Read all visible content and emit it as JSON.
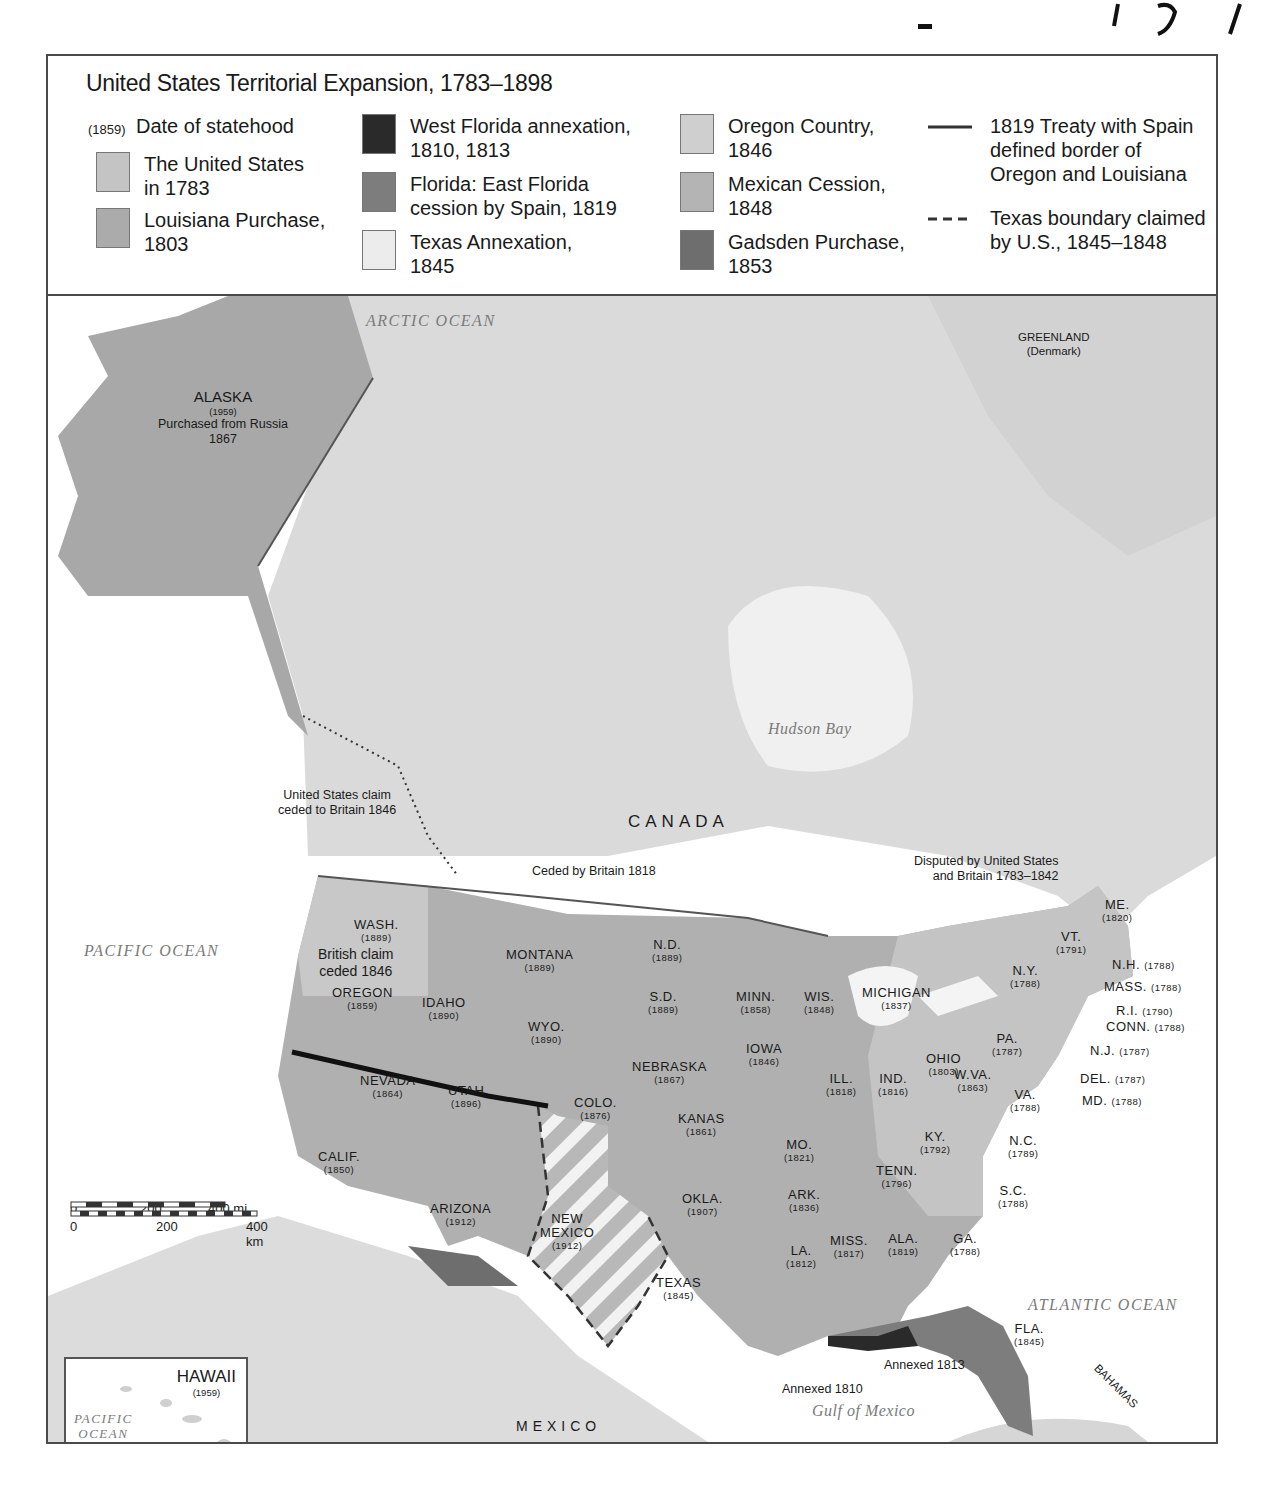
{
  "legend": {
    "title": "United States Territorial Expansion, 1783–1898",
    "statehood_marker": "(1859)",
    "statehood_label": "Date of statehood",
    "items": [
      {
        "label_line1": "The United States",
        "label_line2": "in 1783",
        "color": "#c4c4c4"
      },
      {
        "label_line1": "Louisiana Purchase,",
        "label_line2": "1803",
        "color": "#ababab"
      },
      {
        "label_line1": "West Florida annexation,",
        "label_line2": "1810, 1813",
        "color": "#2a2a2a"
      },
      {
        "label_line1": "Florida: East Florida",
        "label_line2": "cession by Spain, 1819",
        "color": "#7d7d7d"
      },
      {
        "label_line1": "Texas Annexation,",
        "label_line2": "1845",
        "color": "#ececec"
      },
      {
        "label_line1": "Oregon Country,",
        "label_line2": "1846",
        "color": "#cfcfcf"
      },
      {
        "label_line1": "Mexican Cession,",
        "label_line2": "1848",
        "color": "#b4b4b4"
      },
      {
        "label_line1": "Gadsden Purchase,",
        "label_line2": "1853",
        "color": "#6e6e6e"
      }
    ],
    "lines": [
      {
        "label_line1": "1819 Treaty with Spain",
        "label_line2": "defined border of",
        "label_line3": "Oregon and Louisiana",
        "style": "solid"
      },
      {
        "label_line1": "Texas boundary claimed",
        "label_line2": "by U.S., 1845–1848",
        "style": "dashed"
      }
    ]
  },
  "map": {
    "oceans": {
      "arctic": "ARCTIC OCEAN",
      "pacific": "PACIFIC OCEAN",
      "atlantic": "ATLANTIC OCEAN",
      "hudson": "Hudson Bay",
      "gulf": "Gulf of Mexico"
    },
    "countries": {
      "canada": "CANADA",
      "mexico": "MEXICO",
      "greenland": "GREENLAND",
      "greenland_sub": "(Denmark)",
      "bahamas": "BAHAMAS",
      "cuba": "CUBA",
      "puerto_rico": "PUERTO RICO",
      "puerto_rico_year": "(1898)"
    },
    "alaska": {
      "name": "ALASKA",
      "year": "(1959)",
      "note1": "Purchased from Russia",
      "note2": "1867"
    },
    "annotations": {
      "us_claim_1": "United States claim",
      "us_claim_2": "ceded to Britain 1846",
      "ceded_britain": "Ceded by Britain 1818",
      "disputed_1": "Disputed by United States",
      "disputed_2": "and Britain 1783–1842",
      "british_claim_1": "British claim",
      "british_claim_2": "ceded 1846",
      "annexed_1810": "Annexed 1810",
      "annexed_1813": "Annexed 1813"
    },
    "states": [
      {
        "name": "WASH.",
        "year": "(1889)"
      },
      {
        "name": "OREGON",
        "year": "(1859)"
      },
      {
        "name": "IDAHO",
        "year": "(1890)"
      },
      {
        "name": "MONTANA",
        "year": "(1889)"
      },
      {
        "name": "N.D.",
        "year": "(1889)"
      },
      {
        "name": "S.D.",
        "year": "(1889)"
      },
      {
        "name": "WYO.",
        "year": "(1890)"
      },
      {
        "name": "NEVADA",
        "year": "(1864)"
      },
      {
        "name": "UTAH",
        "year": "(1896)"
      },
      {
        "name": "COLO.",
        "year": "(1876)"
      },
      {
        "name": "CALIF.",
        "year": "(1850)"
      },
      {
        "name": "ARIZONA",
        "year": "(1912)"
      },
      {
        "name": "NEW",
        "year": "(1912)",
        "name2": "MEXICO"
      },
      {
        "name": "NEBRASKA",
        "year": "(1867)"
      },
      {
        "name": "KANAS",
        "year": "(1861)"
      },
      {
        "name": "OKLA.",
        "year": "(1907)"
      },
      {
        "name": "TEXAS",
        "year": "(1845)"
      },
      {
        "name": "MINN.",
        "year": "(1858)"
      },
      {
        "name": "IOWA",
        "year": "(1846)"
      },
      {
        "name": "MO.",
        "year": "(1821)"
      },
      {
        "name": "ARK.",
        "year": "(1836)"
      },
      {
        "name": "LA.",
        "year": "(1812)"
      },
      {
        "name": "WIS.",
        "year": "(1848)"
      },
      {
        "name": "ILL.",
        "year": "(1818)"
      },
      {
        "name": "MICHIGAN",
        "year": "(1837)"
      },
      {
        "name": "IND.",
        "year": "(1816)"
      },
      {
        "name": "OHIO",
        "year": "(1803)"
      },
      {
        "name": "KY.",
        "year": "(1792)"
      },
      {
        "name": "TENN.",
        "year": "(1796)"
      },
      {
        "name": "MISS.",
        "year": "(1817)"
      },
      {
        "name": "ALA.",
        "year": "(1819)"
      },
      {
        "name": "GA.",
        "year": "(1788)"
      },
      {
        "name": "FLA.",
        "year": "(1845)"
      },
      {
        "name": "S.C.",
        "year": "(1788)"
      },
      {
        "name": "N.C.",
        "year": "(1789)"
      },
      {
        "name": "VA.",
        "year": "(1788)"
      },
      {
        "name": "W.VA.",
        "year": "(1863)"
      },
      {
        "name": "PA.",
        "year": "(1787)"
      },
      {
        "name": "N.Y.",
        "year": "(1788)"
      },
      {
        "name": "VT.",
        "year": "(1791)"
      },
      {
        "name": "ME.",
        "year": "(1820)"
      }
    ],
    "east_callouts": [
      {
        "name": "N.H.",
        "year": "(1788)"
      },
      {
        "name": "MASS.",
        "year": "(1788)"
      },
      {
        "name": "R.I.",
        "year": "(1790)"
      },
      {
        "name": "CONN.",
        "year": "(1788)"
      },
      {
        "name": "N.J.",
        "year": "(1787)"
      },
      {
        "name": "DEL.",
        "year": "(1787)"
      },
      {
        "name": "MD.",
        "year": "(1788)"
      }
    ],
    "scale": {
      "mi_0": "0",
      "mi_200": "200",
      "mi_400": "400 mi",
      "km_0": "0",
      "km_200": "200",
      "km_400": "400 km"
    },
    "hawaii": {
      "name": "HAWAII",
      "year": "(1959)",
      "ocean1": "PACIFIC",
      "ocean2": "OCEAN",
      "islands": "HAWAIIAN ISLANDS",
      "annexed": "Annexed 1898"
    }
  }
}
